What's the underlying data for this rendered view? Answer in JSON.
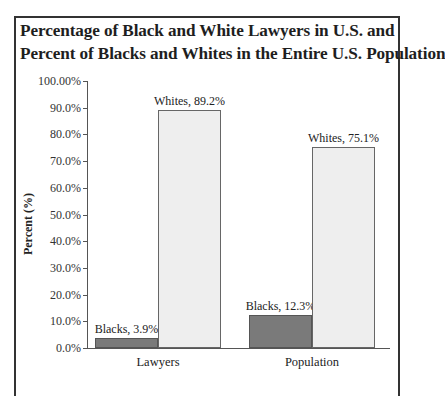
{
  "title_lines": [
    "Percentage of Black and White Lawyers in U.S. and",
    "Percent of Blacks and Whites in the Entire U.S. Population"
  ],
  "colors": {
    "blacks_fill": "#7a7a7a",
    "whites_fill": "#eeeeee",
    "axis": "#555555"
  },
  "chart_data": {
    "type": "bar",
    "title": "Percentage of Black and White Lawyers in U.S. and Percent of Blacks and Whites in the Entire U.S. Population",
    "xlabel": "",
    "ylabel": "Percent (%)",
    "ylim": [
      0,
      100
    ],
    "yticks": [
      "0.0%",
      "10.0%",
      "20.0%",
      "30.0%",
      "40.0%",
      "50.0%",
      "60.0%",
      "70.0%",
      "80.0%",
      "90.0%",
      "100.00%"
    ],
    "categories": [
      "Lawyers",
      "Population"
    ],
    "series": [
      {
        "name": "Blacks",
        "values": [
          3.9,
          12.3
        ],
        "labels": [
          "Blacks, 3.9%",
          "Blacks, 12.3%"
        ]
      },
      {
        "name": "Whites",
        "values": [
          89.2,
          75.1
        ],
        "labels": [
          "Whites, 89.2%",
          "Whites, 75.1%"
        ]
      }
    ],
    "grid": false,
    "legend": "none (data labels on bars)"
  }
}
